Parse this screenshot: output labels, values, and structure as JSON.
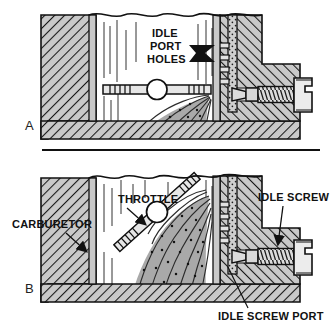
{
  "figure": {
    "background_color": "#ffffff",
    "width": 331,
    "height": 326
  },
  "colors": {
    "outline": "#111111",
    "metal_fill": "#c8c8c8",
    "metal_hatch": "#1a1a1a",
    "passage_fill": "#d9d9d9",
    "spray_fill": "#a8a8a8",
    "spray_streak": "#2b2b2b",
    "bore_fill": "#ffffff",
    "label_text": "#111111",
    "divider": "#111111"
  },
  "panels": [
    {
      "id": "A",
      "label": "A",
      "description": "Throttle plate closed at idle; fuel discharges from idle port holes below the throttle plate",
      "labels": [
        {
          "name": "idle-port-holes",
          "lines": [
            "IDLE",
            "PORT",
            "HOLES"
          ],
          "text": "IDLE PORT HOLES",
          "leader": "filled-arrow-right"
        }
      ]
    },
    {
      "id": "B",
      "label": "B",
      "description": "Throttle plate partly open; fuel discharges through idle port holes and transfer slot",
      "labels": [
        {
          "name": "carburetor",
          "lines": [
            "CARBURETOR"
          ],
          "text": "CARBURETOR",
          "leader": "line-arrow-down-right"
        },
        {
          "name": "throttle",
          "lines": [
            "THROTTLE"
          ],
          "text": "THROTTLE",
          "leader": "line-arrow-down-right"
        },
        {
          "name": "idle-screw",
          "lines": [
            "IDLE SCREW"
          ],
          "text": "IDLE SCREW",
          "leader": "line-arrow-down"
        },
        {
          "name": "idle-screw-port",
          "lines": [
            "IDLE SCREW PORT"
          ],
          "text": "IDLE SCREW PORT",
          "leader": "line-up-left"
        }
      ]
    }
  ],
  "components": {
    "throttle_plate": "throttle plate",
    "idle_mixture_screw": "idle mixture screw",
    "fuel_passage": "idle fuel passage",
    "venturi_bore": "carburetor bore",
    "mounting_flange": "mounting flange"
  }
}
